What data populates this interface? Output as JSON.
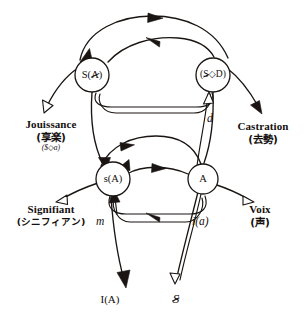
{
  "diagram": {
    "type": "directed-graph",
    "background_color": "#ffffff",
    "line_color": "#1a1512",
    "width": 304,
    "height": 323
  },
  "nodes": [
    {
      "id": "s-barred-A",
      "label_prefix": "S(",
      "label_barred": "A",
      "label_suffix": ")",
      "plain": "S(Ⱥ)",
      "x": 92,
      "y": 75,
      "r": 17
    },
    {
      "id": "barred-S-lozenge-D",
      "label_prefix": "(",
      "label_barred": "S",
      "label_suffix": "◇D)",
      "plain": "($◇D)",
      "x": 213,
      "y": 75,
      "r": 17
    },
    {
      "id": "small-s-A",
      "label_prefix": "",
      "label_barred": "",
      "label_suffix": "s(A)",
      "plain": "s(A)",
      "x": 113,
      "y": 179,
      "r": 17
    },
    {
      "id": "big-A",
      "label_prefix": "",
      "label_barred": "",
      "label_suffix": "A",
      "plain": "A",
      "x": 203,
      "y": 179,
      "r": 15
    }
  ],
  "text_blocks": [
    {
      "id": "jouissance",
      "title": "Jouissance",
      "japanese": "(享楽)",
      "matheme": "($◇a)",
      "x": 8,
      "y": 118,
      "align": "center"
    },
    {
      "id": "castration",
      "title": "Castration",
      "japanese": "(去勢)",
      "matheme": "",
      "x": 228,
      "y": 120,
      "align": "center"
    },
    {
      "id": "signifiant",
      "title": "Signifiant",
      "japanese": "(シニフィアン)",
      "matheme": "",
      "x": 6,
      "y": 203,
      "align": "center"
    },
    {
      "id": "voix",
      "title": "Voix",
      "japanese": "(声)",
      "matheme": "",
      "x": 238,
      "y": 203,
      "align": "center"
    }
  ],
  "edge_labels": [
    {
      "id": "d",
      "text": "d",
      "x": 207,
      "y": 117
    },
    {
      "id": "m",
      "text": "m",
      "x": 98,
      "y": 219
    },
    {
      "id": "i-a",
      "text": "i(a)",
      "x": 194,
      "y": 219
    }
  ],
  "bottom_labels": [
    {
      "id": "I-of-A",
      "text": "I(A)",
      "x": 110,
      "y": 297
    },
    {
      "id": "barred-S",
      "text": "S",
      "barred": true,
      "x": 176,
      "y": 294
    }
  ]
}
